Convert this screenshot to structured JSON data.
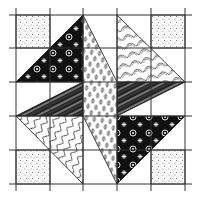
{
  "image": {
    "subject": "Quilt block pattern illustration",
    "grid": {
      "columns": 5,
      "rows": 5,
      "x_lines": [
        16,
        50,
        83,
        117,
        151,
        185
      ],
      "y_lines": [
        15,
        48,
        82,
        116,
        150,
        184
      ]
    },
    "colors": {
      "background": "#ffffff",
      "ink": "#111111",
      "stipple": "#555555",
      "grid_line": "#333333"
    },
    "pieces": [
      {
        "name": "corner-square-top-left",
        "pattern": "stipple",
        "points": "16,15 50,15 50,48 16,48"
      },
      {
        "name": "corner-square-top-right",
        "pattern": "stipple",
        "points": "151,15 185,15 185,48 151,48"
      },
      {
        "name": "corner-square-bottom-left",
        "pattern": "stipple",
        "points": "16,150 50,150 50,184 16,184"
      },
      {
        "name": "corner-square-bottom-right",
        "pattern": "stipple",
        "points": "151,150 185,150 185,184 151,184"
      },
      {
        "name": "floral-triangle-top-left",
        "pattern": "floral",
        "points": "83,15 83,82 16,82"
      },
      {
        "name": "floral-triangle-bottom-right",
        "pattern": "floral",
        "points": "117,116 185,116 117,184"
      },
      {
        "name": "stripe-triangle-left",
        "pattern": "stripes",
        "points": "16,116 83,82 83,116"
      },
      {
        "name": "stripe-triangle-right",
        "pattern": "stripes",
        "points": "117,82 185,82 117,116"
      },
      {
        "name": "wave-triangle-bottom-left",
        "pattern": "waves",
        "points": "16,116 83,116 83,184"
      },
      {
        "name": "leaf-triangle-top-right",
        "pattern": "leaves",
        "points": "117,15 185,82 117,82"
      },
      {
        "name": "oval-center-band",
        "pattern": "ovals",
        "points": "83,15 117,82 117,184 83,116"
      }
    ]
  }
}
